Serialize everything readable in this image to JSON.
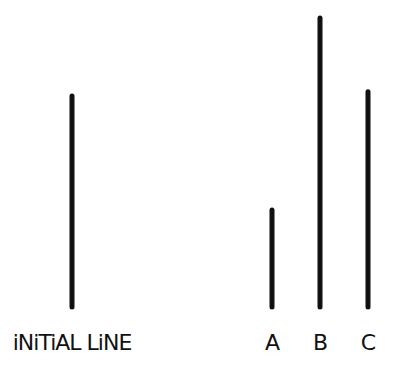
{
  "diagram": {
    "type": "line-length-comparison",
    "line_color": "#111111",
    "reference": {
      "label": "iNiTiAL LiNE",
      "relative_length": 1.0
    },
    "options": [
      {
        "label": "A",
        "relative_length": 0.46
      },
      {
        "label": "B",
        "relative_length": 1.37
      },
      {
        "label": "C",
        "relative_length": 1.02
      }
    ]
  }
}
